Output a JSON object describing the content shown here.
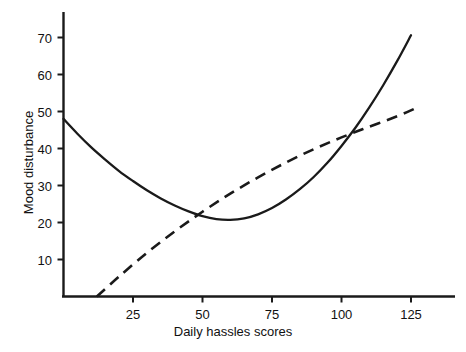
{
  "chart_data": {
    "type": "line",
    "title": "",
    "xlabel": "Daily hassles scores",
    "ylabel": "Mood disturbance",
    "xlim": [
      0,
      140
    ],
    "ylim": [
      0,
      76
    ],
    "xticks": [
      25,
      50,
      75,
      100,
      125
    ],
    "yticks": [
      10,
      20,
      30,
      40,
      50,
      60,
      70
    ],
    "grid": false,
    "legend": "none",
    "series": [
      {
        "name": "solid-curve",
        "style": "solid",
        "color": "#1a1a1a",
        "x": [
          0,
          5,
          10,
          15,
          20,
          25,
          30,
          35,
          40,
          45,
          50,
          55,
          60,
          65,
          70,
          75,
          80,
          85,
          90,
          95,
          100,
          105,
          110,
          115,
          120,
          125
        ],
        "y": [
          48.0,
          44.0,
          40.3,
          37.0,
          33.9,
          31.2,
          28.7,
          26.5,
          24.6,
          23.0,
          21.7,
          20.9,
          20.7,
          21.1,
          22.2,
          23.9,
          26.2,
          29.0,
          32.3,
          36.2,
          40.7,
          45.6,
          51.1,
          57.1,
          63.6,
          70.6
        ]
      },
      {
        "name": "dashed-line",
        "style": "dashed",
        "color": "#1a1a1a",
        "x": [
          12,
          20,
          30,
          40,
          50,
          60,
          70,
          80,
          90,
          100,
          110,
          120,
          127
        ],
        "y": [
          0.0,
          5.4,
          11.8,
          17.6,
          22.9,
          27.8,
          32.2,
          36.2,
          39.8,
          43.0,
          45.9,
          48.7,
          51.0
        ]
      }
    ]
  },
  "axis": {
    "x_title": "Daily hassles scores",
    "y_title": "Mood disturbance",
    "x_tick_labels": [
      "25",
      "50",
      "75",
      "100",
      "125"
    ],
    "y_tick_labels": [
      "10",
      "20",
      "30",
      "40",
      "50",
      "60",
      "70"
    ]
  },
  "colors": {
    "ink": "#1a1a1a",
    "background": "#ffffff"
  }
}
